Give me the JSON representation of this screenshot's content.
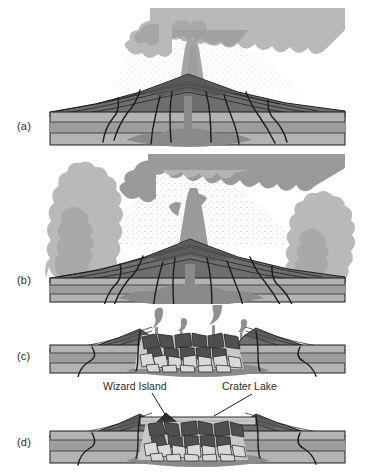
{
  "figure": {
    "background_color": "#ffffff",
    "width": 368,
    "height": 475
  },
  "colors": {
    "ash_cloud_light": "#b9b9b9",
    "ash_cloud_dark": "#9a9a9a",
    "ash_fall_stipple": "#cfcfcf",
    "eruption_column": "#a5a5a5",
    "cone_strata_dark": "#545454",
    "cone_strata_mid": "#6e6e6e",
    "bedrock_upper": "#b3b3b3",
    "bedrock_mid": "#9d9d9d",
    "bedrock_lower": "#aaaaaa",
    "magma": "#8a8a8a",
    "breccia_block_light": "#d6d6d6",
    "breccia_block_dark": "#5a5a5a",
    "lake_water": "#c9c9c9",
    "outline": "#1c1c1c",
    "text": "#2b2b2b"
  },
  "panels": [
    {
      "id": "a",
      "label": "(a)",
      "stage_name": "climactic-eruption",
      "description": "Vertical eruption column from central vent with spreading ash cloud and ash fall",
      "features": [
        "central-vent",
        "eruption-column",
        "ash-cloud",
        "ash-fall",
        "composite-cone",
        "bedrock-strata",
        "magma-chamber"
      ]
    },
    {
      "id": "b",
      "label": "(b)",
      "stage_name": "ring-vent-eruption",
      "description": "Eruption continues from central vent plus flanking ring vents producing lateral ash columns",
      "features": [
        "central-vent",
        "flank-vent-left",
        "flank-vent-right",
        "eruption-column",
        "ash-cloud",
        "ash-fall",
        "composite-cone",
        "bedrock-strata",
        "magma-chamber"
      ]
    },
    {
      "id": "c",
      "label": "(c)",
      "stage_name": "caldera-collapse",
      "description": "Summit collapses into the emptied magma chamber forming a caldera filled with collapse breccia; small fumaroles vent steam",
      "features": [
        "caldera-depression",
        "collapse-breccia",
        "fumaroles",
        "bedrock-strata",
        "drained-magma-chamber"
      ]
    },
    {
      "id": "d",
      "label": "(d)",
      "stage_name": "crater-lake-and-wizard-island",
      "description": "Caldera fills with water forming Crater Lake; a small cinder cone builds Wizard Island",
      "features": [
        "crater-lake",
        "wizard-island",
        "collapse-breccia",
        "bedrock-strata"
      ],
      "callouts": [
        {
          "id": "wizard-island",
          "text": "Wizard Island"
        },
        {
          "id": "crater-lake",
          "text": "Crater Lake"
        }
      ]
    }
  ]
}
